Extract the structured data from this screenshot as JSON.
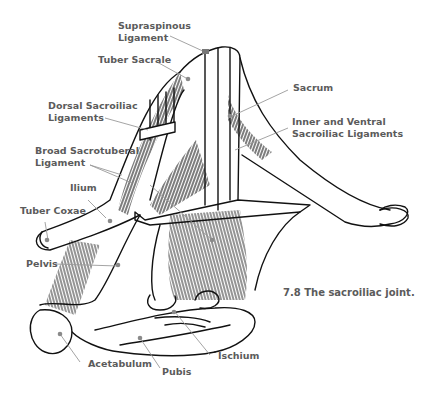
{
  "figure": {
    "caption": "7.8  The sacroiliac joint.",
    "leader_color": "#9a9a9a",
    "label_color": "#5b5b5b",
    "line_color": "#111111"
  },
  "labels": {
    "supraspinous_1": "Supraspinous",
    "supraspinous_2": "Ligament",
    "tuber_sacrale": "Tuber Sacrale",
    "dorsal_1": "Dorsal Sacroiliac",
    "dorsal_2": "Ligaments",
    "broad_1": "Broad Sacrotuberal",
    "broad_2": "Ligament",
    "ilium": "Ilium",
    "tuber_coxae": "Tuber Coxae",
    "pelvis": "Pelvis",
    "sacrum": "Sacrum",
    "inner_1": "Inner and Ventral",
    "inner_2": "Sacroiliac Ligaments",
    "acetabulum": "Acetabulum",
    "pubis": "Pubis",
    "ischium": "Ischium"
  }
}
